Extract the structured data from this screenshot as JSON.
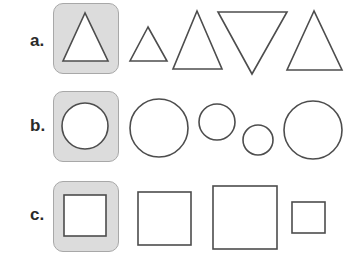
{
  "rows": [
    {
      "label": "a.",
      "shape_type": "triangle",
      "highlighted_index": 0,
      "items": [
        {
          "kind": "triangle-up",
          "points": "85,13 63,61 108,61",
          "highlighted": true
        },
        {
          "kind": "triangle-up",
          "points": "148,27 130,61 167,61",
          "highlighted": false
        },
        {
          "kind": "triangle-up",
          "points": "197,11 173,69 222,69",
          "highlighted": false
        },
        {
          "kind": "triangle-down",
          "points": "218,12 287,12 252,74",
          "highlighted": false
        },
        {
          "kind": "triangle-up",
          "points": "314,11 287,70 342,70",
          "highlighted": false
        }
      ]
    },
    {
      "label": "b.",
      "shape_type": "circle",
      "highlighted_index": 0,
      "items": [
        {
          "kind": "circle",
          "cx": 85,
          "cy": 126,
          "r": 23,
          "highlighted": true
        },
        {
          "kind": "circle",
          "cx": 159,
          "cy": 128,
          "r": 29,
          "highlighted": false
        },
        {
          "kind": "circle",
          "cx": 217,
          "cy": 122,
          "r": 18,
          "highlighted": false
        },
        {
          "kind": "circle",
          "cx": 258,
          "cy": 140,
          "r": 15,
          "highlighted": false
        },
        {
          "kind": "circle",
          "cx": 313,
          "cy": 130,
          "r": 29,
          "highlighted": false
        }
      ]
    },
    {
      "label": "c.",
      "shape_type": "square",
      "highlighted_index": 0,
      "items": [
        {
          "kind": "square",
          "x": 64,
          "y": 195,
          "w": 42,
          "h": 41,
          "highlighted": true
        },
        {
          "kind": "square",
          "x": 138,
          "y": 192,
          "w": 53,
          "h": 53,
          "highlighted": false
        },
        {
          "kind": "square",
          "x": 213,
          "y": 186,
          "w": 64,
          "h": 63,
          "highlighted": false
        },
        {
          "kind": "square",
          "x": 292,
          "y": 202,
          "w": 33,
          "h": 31,
          "highlighted": false
        }
      ]
    }
  ],
  "colors": {
    "highlight_fill": "#dcdcdc",
    "highlight_border": "#a8a8a8",
    "shape_stroke": "#4d4d4d",
    "label": "#2a2a2a"
  }
}
